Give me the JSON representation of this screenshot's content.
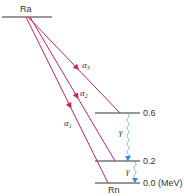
{
  "diagram": {
    "title": "",
    "parent_nucleus": "Ra",
    "daughter_nucleus": "Rn",
    "levels": [
      {
        "id": "ra",
        "label": "Ra",
        "y": 17,
        "x1": 2,
        "x2": 52
      },
      {
        "id": "e06",
        "label": "0.6",
        "energy_mev": 0.6,
        "y": 113,
        "x1": 95,
        "x2": 140
      },
      {
        "id": "e02",
        "label": "0.2",
        "energy_mev": 0.2,
        "y": 161,
        "x1": 95,
        "x2": 140
      },
      {
        "id": "e00",
        "label": "0.0 (MeV)",
        "energy_mev": 0.0,
        "y": 183,
        "x1": 95,
        "x2": 140
      }
    ],
    "alpha_transitions": [
      {
        "label": "α",
        "sub": "3",
        "to": "0.6"
      },
      {
        "label": "α",
        "sub": "2",
        "to": "0.2"
      },
      {
        "label": "α",
        "sub": "1",
        "to": "0.0"
      }
    ],
    "gamma_transitions": [
      {
        "label": "γ",
        "from": "0.6",
        "to": "0.2"
      },
      {
        "label": "γ",
        "from": "0.2",
        "to": "0.0"
      }
    ],
    "colors": {
      "alpha": "#c8245a",
      "gamma": "#2a8fd6",
      "level": "#333333",
      "text": "#333333"
    }
  }
}
